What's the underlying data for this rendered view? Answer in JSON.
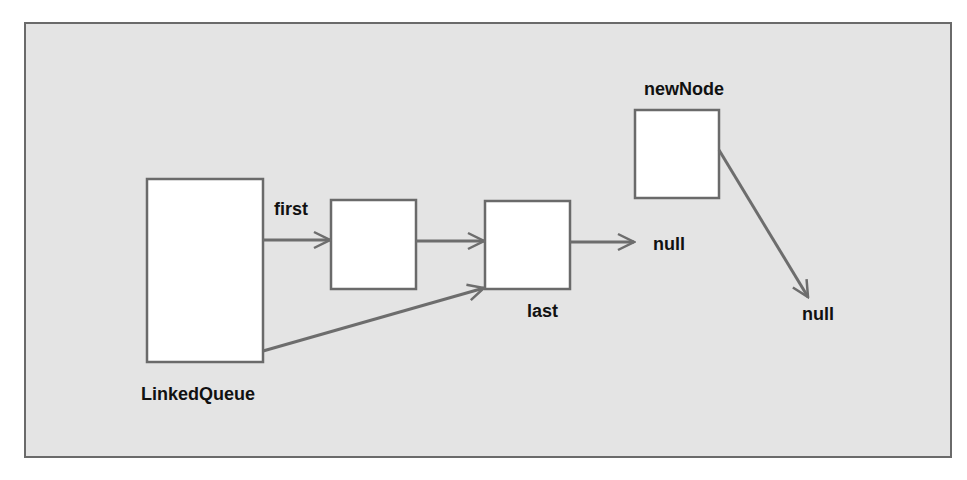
{
  "diagram": {
    "title": "",
    "colors": {
      "background": "#e4e4e4",
      "frame_border": "#6a6a6a",
      "node_fill": "#ffffff",
      "arrow": "#6d6d6d",
      "text": "#111111"
    },
    "nodes": [
      {
        "id": "linked-queue",
        "label": "LinkedQueue"
      },
      {
        "id": "node-1",
        "label": ""
      },
      {
        "id": "node-2",
        "label": "last"
      },
      {
        "id": "new-node",
        "label": "newNode"
      }
    ],
    "labels": {
      "first": "first",
      "last": "last",
      "new_node": "newNode",
      "linked_queue": "LinkedQueue",
      "null_1": "null",
      "null_2": "null"
    },
    "edges": [
      {
        "from": "linked-queue",
        "to": "node-1",
        "label": "first"
      },
      {
        "from": "node-1",
        "to": "node-2",
        "label": ""
      },
      {
        "from": "linked-queue",
        "to": "node-2",
        "label": "last"
      },
      {
        "from": "node-2",
        "to": "null_1",
        "label": ""
      },
      {
        "from": "new-node",
        "to": "null_2",
        "label": ""
      }
    ]
  }
}
